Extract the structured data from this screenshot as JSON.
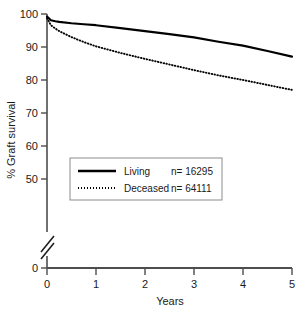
{
  "chart_data": {
    "type": "line",
    "title": "",
    "xlabel": "Years",
    "ylabel": "% Graft survival",
    "xlim": [
      0,
      5
    ],
    "ylim": [
      45,
      100
    ],
    "y_axis_break": true,
    "y_break_label": "0",
    "grid": false,
    "legend_position": "center",
    "xticks": [
      "0",
      "1",
      "2",
      "3",
      "4",
      "5"
    ],
    "yticks": [
      "50",
      "60",
      "70",
      "80",
      "90",
      "100"
    ],
    "series": [
      {
        "name": "Living",
        "n_label": "n= 16295",
        "n": 16295,
        "style": "solid",
        "color": "#000000",
        "x": [
          0,
          0.08,
          0.17,
          0.25,
          0.5,
          0.75,
          1,
          1.5,
          2,
          2.5,
          3,
          3.5,
          4,
          4.5,
          5
        ],
        "y": [
          99.2,
          98.1,
          97.8,
          97.6,
          97.2,
          96.9,
          96.6,
          95.7,
          94.8,
          93.9,
          92.9,
          91.6,
          90.4,
          88.8,
          87.1
        ]
      },
      {
        "name": "Deceased",
        "n_label": "n= 64111",
        "n": 64111,
        "style": "dotted",
        "color": "#000000",
        "x": [
          0,
          0.08,
          0.17,
          0.25,
          0.5,
          0.75,
          1,
          1.5,
          2,
          2.5,
          3,
          3.5,
          4,
          4.5,
          5
        ],
        "y": [
          98.7,
          96.6,
          95.6,
          94.8,
          93.0,
          91.5,
          90.2,
          88.2,
          86.4,
          84.7,
          83.0,
          81.4,
          80.0,
          78.5,
          77.0
        ]
      }
    ]
  },
  "axis": {
    "y_title": "% Graft survival",
    "x_title": "Years",
    "zero_label": "0"
  },
  "legend": {
    "rows": [
      {
        "label": "Living",
        "n_label": "n= 16295"
      },
      {
        "label": "Deceased",
        "n_label": "n= 64111"
      }
    ]
  },
  "colors": {
    "axis": "#4d4d4d",
    "series": "#000000",
    "legend_border": "#8c8c8c",
    "text": "#1a1a1a",
    "background": "#ffffff"
  }
}
